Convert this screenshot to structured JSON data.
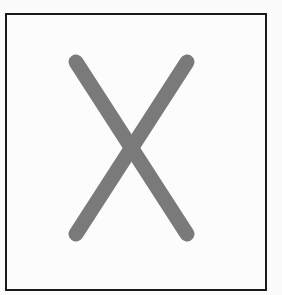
{
  "figure": {
    "shape": "x-mark",
    "icon": "close-icon",
    "stroke_color": "#7a7a7a",
    "frame_color": "#1a1a1a",
    "background_color": "#fcfcfc"
  }
}
